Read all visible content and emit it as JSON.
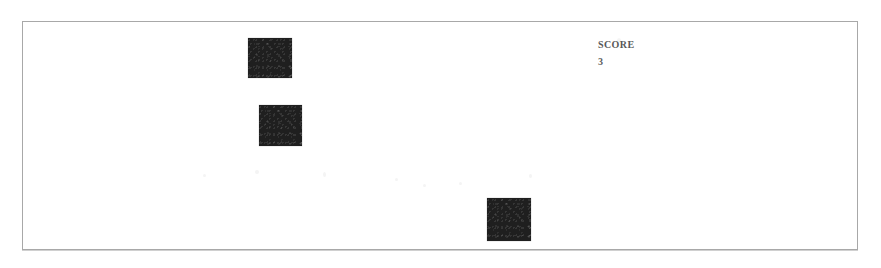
{
  "screen": {
    "width": 881,
    "height": 268,
    "background_color": "#ffffff",
    "frame_color": "#a8a8a8"
  },
  "game": {
    "name": "block-game-field",
    "field": {
      "x": 22,
      "y": 21,
      "width": 836,
      "height": 229
    },
    "block_color": "#1f1f1f",
    "blocks": [
      {
        "name": "block-1",
        "x": 248,
        "y": 38,
        "width": 44,
        "height": 40
      },
      {
        "name": "block-2",
        "x": 259,
        "y": 105,
        "width": 43,
        "height": 41
      },
      {
        "name": "block-3",
        "x": 487,
        "y": 198,
        "width": 44,
        "height": 43
      }
    ]
  },
  "hud": {
    "x": 598,
    "y": 39,
    "score_label": "SCORE",
    "score_value": "3"
  }
}
